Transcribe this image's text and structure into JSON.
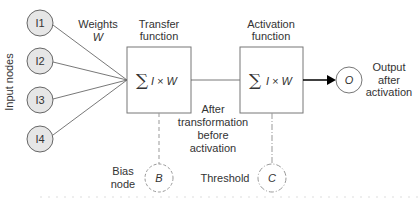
{
  "diagram": {
    "input_axis_label": "Input nodes",
    "inputs": [
      {
        "label": "I1",
        "cx": 40,
        "cy": 23
      },
      {
        "label": "I2",
        "cx": 40,
        "cy": 61
      },
      {
        "label": "I3",
        "cx": 40,
        "cy": 100
      },
      {
        "label": "I4",
        "cx": 40,
        "cy": 139
      }
    ],
    "weights_label": "Weights",
    "weights_symbol": "W",
    "transfer": {
      "title_line1": "Transfer",
      "title_line2": "function",
      "formula_sum": "∑",
      "formula_rest": "I × W"
    },
    "activation": {
      "title_line1": "Activation",
      "title_line2": "function",
      "formula_sum": "∑",
      "formula_rest": "I × W"
    },
    "middle_note": [
      "After",
      "transformation",
      "before",
      "activation"
    ],
    "output": {
      "symbol": "O",
      "label_lines": [
        "Output",
        "after",
        "activation"
      ]
    },
    "bias": {
      "label_lines": [
        "Bias",
        "node"
      ],
      "symbol": "B"
    },
    "threshold": {
      "label": "Threshold",
      "symbol": "C"
    },
    "colors": {
      "node_fill": "#e6e6e6",
      "stroke": "#555555",
      "dashed": "#999999",
      "arrow": "#000000"
    }
  }
}
